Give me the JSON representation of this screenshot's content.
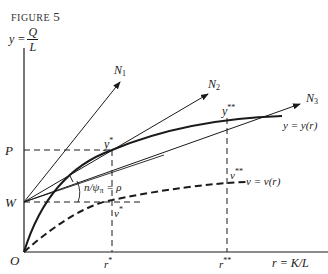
{
  "figure": {
    "label": "FIGURE",
    "number": "5"
  },
  "axes": {
    "y_label_lhs": "y =",
    "y_label_num": "Q",
    "y_label_den": "L",
    "x_label": "r = K/L",
    "origin": "O"
  },
  "labels": {
    "P": "P",
    "W": "W",
    "N1": "N",
    "N1_sub": "1",
    "N2": "N",
    "N2_sub": "2",
    "N3": "N",
    "N3_sub": "3",
    "y_star": "y",
    "y_star_sup": "*",
    "y_dstar": "y",
    "y_dstar_sup": "**",
    "v_star": "v",
    "v_star_sup": "*",
    "v_dstar": "v",
    "v_dstar_sup": "**",
    "r_star": "r",
    "r_star_sup": "*",
    "r_dstar": "r",
    "r_dstar_sup": "**",
    "curve_y": "y = y(r)",
    "curve_v": "v = v(r)",
    "angle": "n/ψ",
    "angle_sub": "π",
    "angle_rhs": "= ρ"
  },
  "caption": "C. The (cut-off caption)",
  "colors": {
    "ink": "#1a1a1a",
    "background": "#ffffff"
  }
}
